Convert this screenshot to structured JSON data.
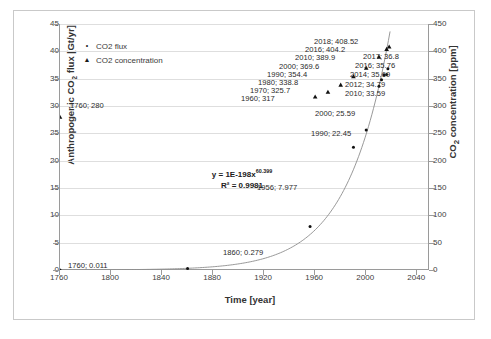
{
  "chart_data": {
    "type": "scatter",
    "title": "",
    "xlabel": "Time [year]",
    "ylabel": "Anthropogenic CO2 flux [Gt/yr]",
    "y2label": "CO2 concentration [ppm]",
    "xlim": [
      1760,
      2050
    ],
    "ylim": [
      0,
      45
    ],
    "y2lim": [
      0,
      450
    ],
    "xticks": [
      1760,
      1800,
      1840,
      1880,
      1920,
      1960,
      2000,
      2040
    ],
    "yticks": [
      0,
      5,
      10,
      15,
      20,
      25,
      30,
      35,
      40,
      45
    ],
    "y2ticks": [
      0,
      50,
      100,
      150,
      200,
      250,
      300,
      350,
      400,
      450
    ],
    "grid": true,
    "legend_position": "upper-left-inside",
    "annotation": {
      "equation": "y = 1E-198x",
      "exponent": "60.399",
      "r2": "R² = 0.9981"
    },
    "series": [
      {
        "name": "CO2 flux",
        "marker": "dot",
        "axis": "left",
        "unit": "Gt/yr",
        "points": [
          {
            "x": 1760,
            "y": 0.011,
            "label": "1760; 0.011"
          },
          {
            "x": 1860,
            "y": 0.279,
            "label": "1860; 0.279"
          },
          {
            "x": 1956,
            "y": 7.977,
            "label": "1956; 7.977"
          },
          {
            "x": 1990,
            "y": 22.45,
            "label": "1990; 22.45"
          },
          {
            "x": 2000,
            "y": 25.59,
            "label": "2000; 25.59"
          },
          {
            "x": 2010,
            "y": 33.59,
            "label": "2010; 33.59"
          },
          {
            "x": 2012,
            "y": 34.79,
            "label": "2012; 34.79"
          },
          {
            "x": 2014,
            "y": 35.69,
            "label": "2014; 35.69"
          },
          {
            "x": 2016,
            "y": 35.76,
            "label": "2016; 35.76"
          },
          {
            "x": 2017,
            "y": 36.8,
            "label": "2017; 36.8"
          }
        ]
      },
      {
        "name": "CO2 concentration",
        "marker": "triangle",
        "axis": "right",
        "unit": "ppm",
        "points": [
          {
            "x": 1760,
            "y": 280,
            "label": "1760; 280"
          },
          {
            "x": 1960,
            "y": 317,
            "label": "1960; 317"
          },
          {
            "x": 1970,
            "y": 325.7,
            "label": "1970; 325.7"
          },
          {
            "x": 1980,
            "y": 338.8,
            "label": "1980; 338.8"
          },
          {
            "x": 1990,
            "y": 354.4,
            "label": "1990; 354.4"
          },
          {
            "x": 2000,
            "y": 369.6,
            "label": "2000; 369.6"
          },
          {
            "x": 2010,
            "y": 389.9,
            "label": "2010; 389.9"
          },
          {
            "x": 2016,
            "y": 404.2,
            "label": "2016; 404.2"
          },
          {
            "x": 2018,
            "y": 408.52,
            "label": "2018; 408.52"
          }
        ]
      }
    ]
  },
  "legend": {
    "items": [
      {
        "marker": "•",
        "label": "CO2 flux"
      },
      {
        "marker": "▲",
        "label": "CO2 concentration"
      }
    ]
  },
  "axes": {
    "y_title_main": "Anthropogenic CO",
    "y_title_sub": "2",
    "y_title_tail": " flux [Gt/yr]",
    "y2_title_main": "CO",
    "y2_title_sub": "2",
    "y2_title_tail": " concentration [ppm]",
    "x_title": "Time [year]",
    "yticks": [
      "0",
      "5",
      "10",
      "15",
      "20",
      "25",
      "30",
      "35",
      "40",
      "45"
    ],
    "y2ticks": [
      "0",
      "50",
      "100",
      "150",
      "200",
      "250",
      "300",
      "350",
      "400",
      "450"
    ],
    "xticks": [
      "1760",
      "1800",
      "1840",
      "1880",
      "1920",
      "1960",
      "2000",
      "2040"
    ]
  },
  "annotation": {
    "eq_prefix": "y = 1E-198x",
    "eq_exponent": "60.399",
    "r2": "R² = 0.9981"
  },
  "labels": {
    "flux": [
      "1760; 0.011",
      "1860; 0.279",
      "1956; 7.977",
      "1990; 22.45",
      "2000; 25.59",
      "2010; 33.59",
      "2012; 34.79",
      "2014; 35.69",
      "2016; 35.76",
      "2017; 36.8"
    ],
    "conc": [
      "1760; 280",
      "1960; 317",
      "1970; 325.7",
      "1980; 338.8",
      "1990; 354.4",
      "2000; 369.6",
      "2010; 389.9",
      "2016; 404.2",
      "2018; 408.52"
    ]
  }
}
